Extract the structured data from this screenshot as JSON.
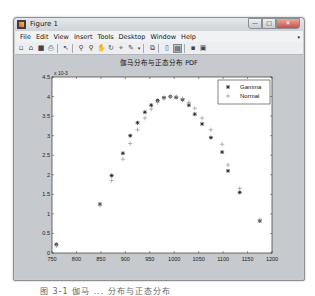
{
  "window": {
    "title": "Figure 1",
    "buttons": {
      "minimize": "—",
      "maximize": "□",
      "close": "✕"
    }
  },
  "menubar": {
    "items": [
      "File",
      "Edit",
      "View",
      "Insert",
      "Tools",
      "Desktop",
      "Window",
      "Help"
    ],
    "overflow_icon": "▾"
  },
  "toolbar": {
    "icons": [
      "new-figure-icon",
      "open-file-icon",
      "save-icon",
      "print-icon",
      "select-arrow-icon",
      "zoom-in-icon",
      "zoom-out-icon",
      "pan-icon",
      "rotate-3d-icon",
      "data-cursor-icon",
      "brush-icon",
      "link-plot-icon",
      "colorbar-icon",
      "legend-icon",
      "hide-plot-tools-icon",
      "show-plot-tools-icon"
    ]
  },
  "caption": "图 3-1  伽马 ... 分布与正态分布",
  "chart_data": {
    "type": "scatter",
    "title": "伽马分布与正态分布 PDF",
    "xlabel": "",
    "ylabel": "",
    "y_exponent_label": "x 10^-3",
    "xlim": [
      750,
      1200
    ],
    "ylim": [
      0,
      4.5
    ],
    "xticks": [
      750,
      800,
      850,
      900,
      950,
      1000,
      1050,
      1100,
      1150,
      1200
    ],
    "yticks": [
      0,
      0.5,
      1,
      1.5,
      2,
      2.5,
      3,
      3.5,
      4,
      4.5
    ],
    "grid": false,
    "legend_position": "northeast",
    "series": [
      {
        "name": "Gamma",
        "marker": "*",
        "color": "#222222",
        "x": [
          759,
          848,
          872,
          895,
          910,
          925,
          940,
          953,
          966,
          979,
          992,
          1004,
          1017,
          1030,
          1042,
          1057,
          1075,
          1098,
          1110,
          1134,
          1175
        ],
        "y": [
          0.22,
          1.25,
          1.98,
          2.55,
          3.0,
          3.33,
          3.6,
          3.78,
          3.9,
          3.97,
          4.0,
          3.98,
          3.92,
          3.78,
          3.55,
          3.3,
          2.95,
          2.58,
          2.1,
          1.55,
          0.82
        ]
      },
      {
        "name": "Normal",
        "marker": "+",
        "color": "#9a9a9a",
        "x": [
          759,
          848,
          872,
          895,
          910,
          925,
          940,
          953,
          966,
          979,
          992,
          1004,
          1017,
          1030,
          1042,
          1057,
          1075,
          1098,
          1110,
          1134,
          1175
        ],
        "y": [
          0.18,
          1.22,
          1.85,
          2.4,
          2.8,
          3.15,
          3.45,
          3.68,
          3.85,
          3.95,
          4.0,
          4.0,
          3.95,
          3.85,
          3.7,
          3.45,
          3.15,
          2.78,
          2.25,
          1.65,
          0.85
        ]
      }
    ]
  }
}
